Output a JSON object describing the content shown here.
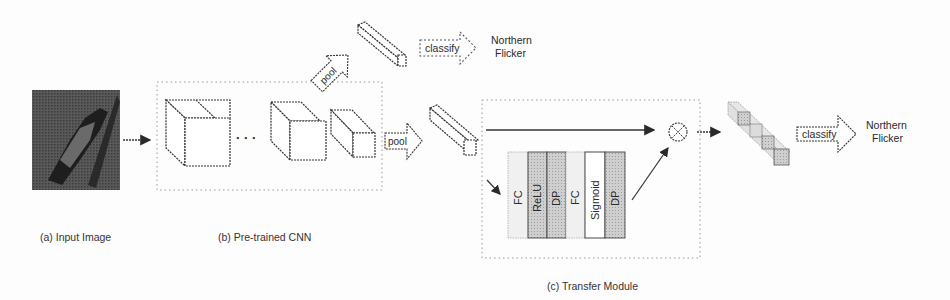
{
  "diagram": {
    "type": "neural-network-architecture",
    "captions": {
      "input": "(a) Input Image",
      "cnn": "(b) Pre-trained CNN",
      "transfer": "(c) Transfer Module"
    },
    "cnn": {
      "ellipsis": "· · ·"
    },
    "top_branch": {
      "pool_label": "pool",
      "classify_label": "classify",
      "output_line1": "Northern",
      "output_line2": "Flicker"
    },
    "main_branch": {
      "pool_label": "pool",
      "classify_label": "classify",
      "output_line1": "Northern",
      "output_line2": "Flicker"
    },
    "transfer_module": {
      "operator_symbol": "⊗",
      "layers": [
        {
          "label": "FC",
          "fill": "#ededed"
        },
        {
          "label": "ReLU",
          "fill": "#b9b9b9"
        },
        {
          "label": "DP",
          "fill": "#c4c4c4"
        },
        {
          "label": "FC",
          "fill": "#ededed"
        },
        {
          "label": "Sigmoid",
          "fill": "#ffffff"
        },
        {
          "label": "DP",
          "fill": "#c4c4c4"
        }
      ]
    },
    "colors": {
      "stroke": "#3a3a3a",
      "dotted_border": "#8a8a8a",
      "image_dark": "#3b3b3b"
    }
  }
}
